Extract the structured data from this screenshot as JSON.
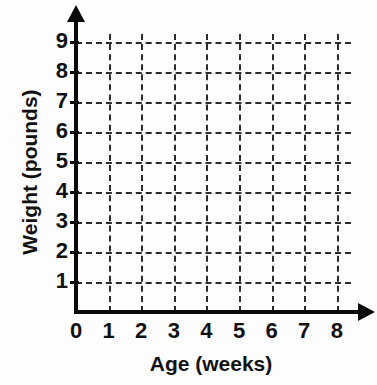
{
  "chart_data": {
    "type": "scatter",
    "title": "",
    "subtitle": "",
    "xlabel": "Age (weeks)",
    "ylabel": "Weight (pounds)",
    "xlim": [
      0,
      8
    ],
    "ylim": [
      0,
      9
    ],
    "x_ticks": [
      "0",
      "1",
      "2",
      "3",
      "4",
      "5",
      "6",
      "7",
      "8"
    ],
    "y_ticks": [
      "0",
      "1",
      "2",
      "3",
      "4",
      "5",
      "6",
      "7",
      "8",
      "9"
    ],
    "x_tick_values": [
      0,
      1,
      2,
      3,
      4,
      5,
      6,
      7,
      8
    ],
    "y_tick_values": [
      0,
      1,
      2,
      3,
      4,
      5,
      6,
      7,
      8,
      9
    ],
    "grid": true,
    "grid_style": "dashed",
    "legend": null,
    "series": [
      {
        "name": "",
        "x": [],
        "y": []
      }
    ],
    "annotations": [],
    "note": "Empty coordinate grid — no data points are plotted."
  },
  "axes": {
    "origin_label": "0",
    "y_axis_title": "Weight (pounds)",
    "x_axis_title": "Age (weeks)",
    "y_tick_labels": [
      "9",
      "8",
      "7",
      "6",
      "5",
      "4",
      "3",
      "2",
      "1"
    ],
    "x_tick_labels": [
      "0",
      "1",
      "2",
      "3",
      "4",
      "5",
      "6",
      "7",
      "8"
    ]
  },
  "colors": {
    "axis": "#0a0a0a",
    "gridline": "#2b2b2b",
    "text": "#111111",
    "background": "#fdfdfd"
  }
}
